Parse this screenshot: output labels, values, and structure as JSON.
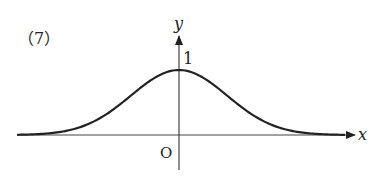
{
  "problem_label": "（7）",
  "chart_data": {
    "type": "line",
    "title": "(7)",
    "xlabel": "x",
    "ylabel": "y",
    "origin_label": "O",
    "annotations": [
      {
        "text": "1",
        "at": "y-intercept (peak)"
      }
    ],
    "function_shape": "gaussian-like",
    "peak": {
      "x": 0,
      "y": 1
    },
    "asymptote": "y = 0",
    "grid": false,
    "legend": "none"
  },
  "colors": {
    "curve": "#222222",
    "axes": "#333333"
  }
}
